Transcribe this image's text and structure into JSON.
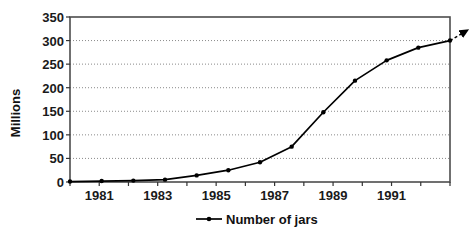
{
  "chart_data": {
    "type": "line",
    "title": "",
    "xlabel": "",
    "ylabel": "Millions",
    "ylim": [
      0,
      350
    ],
    "ytick_values": [
      0,
      50,
      100,
      150,
      200,
      250,
      300,
      350
    ],
    "ytick_labels": [
      "0",
      "50",
      "100",
      "150",
      "200",
      "250",
      "300",
      "350"
    ],
    "x": [
      1980,
      1981,
      1982,
      1983,
      1984,
      1985,
      1986,
      1987,
      1988,
      1989,
      1990,
      1991,
      1992
    ],
    "xtick_labels_shown": [
      "1981",
      "1983",
      "1985",
      "1987",
      "1989",
      "1991"
    ],
    "xtick_label_values": [
      1981,
      1983,
      1985,
      1987,
      1989,
      1991
    ],
    "series": [
      {
        "name": "Number of jars",
        "values": [
          1,
          2,
          3,
          5,
          14,
          25,
          42,
          75,
          148,
          215,
          258,
          285,
          300
        ],
        "color": "#000000",
        "marker": "dot"
      }
    ],
    "annotation": {
      "type": "dashed-arrow",
      "from_x": 1992,
      "from_y": 300,
      "to_x": 1992.55,
      "to_y": 322,
      "label": ""
    },
    "grid": {
      "horizontal": true,
      "vertical": false,
      "style": "dotted",
      "color": "#808080"
    },
    "legend": {
      "position": "bottom",
      "entries": [
        "Number of jars"
      ]
    },
    "plot_border_color": "#4d4d4d",
    "background": "#ffffff"
  }
}
